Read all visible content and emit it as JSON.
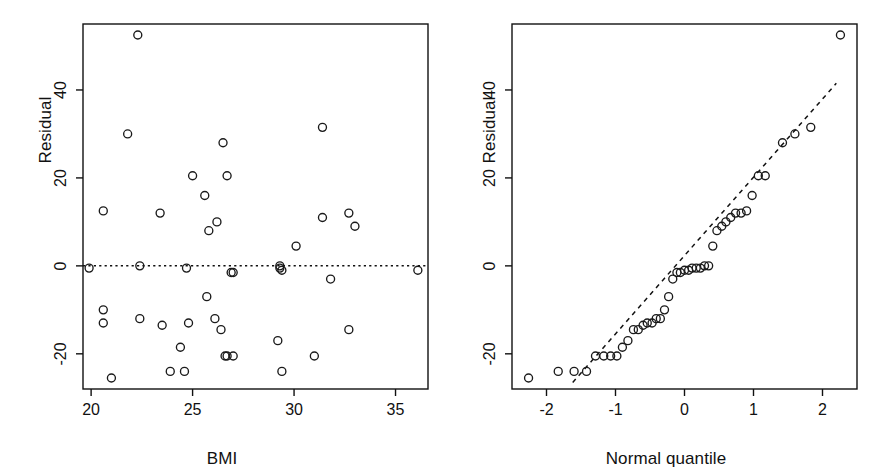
{
  "figure": {
    "background": "#ffffff",
    "ink": "#111111",
    "point_color": "#1a1a1a",
    "panels": 2
  },
  "chart_data": [
    {
      "type": "scatter",
      "panel": "left",
      "title": "",
      "xlabel": "BMI",
      "ylabel": "Residual",
      "xlim": [
        19.6,
        36.6
      ],
      "ylim": [
        -28,
        55
      ],
      "xticks": [
        20,
        25,
        30,
        35
      ],
      "xtick_labels": [
        "20",
        "25",
        "30",
        "35"
      ],
      "yticks": [
        -20,
        0,
        20,
        40
      ],
      "ytick_labels": [
        "-20",
        "0",
        "20",
        "40"
      ],
      "grid": false,
      "legend": "none",
      "reference_line": {
        "kind": "horizontal",
        "y": 0,
        "style": "dotted"
      },
      "marker": "open-circle",
      "x": [
        19.9,
        20.6,
        20.6,
        20.6,
        21.0,
        21.8,
        22.3,
        22.4,
        22.4,
        23.4,
        23.5,
        23.9,
        24.4,
        24.6,
        24.7,
        24.8,
        25.0,
        25.6,
        25.7,
        25.8,
        26.1,
        26.2,
        26.4,
        26.5,
        26.6,
        26.7,
        26.7,
        26.9,
        27.0,
        27.0,
        29.2,
        29.3,
        29.3,
        29.4,
        29.4,
        30.1,
        31.0,
        31.4,
        31.4,
        31.8,
        32.7,
        32.7,
        33.0,
        36.1
      ],
      "y": [
        -0.5,
        12.5,
        -10.0,
        -13.0,
        -25.5,
        30.0,
        52.5,
        0.0,
        -12.0,
        12.0,
        -13.5,
        -24.0,
        -18.5,
        -24.0,
        -0.5,
        -13.0,
        20.5,
        16.0,
        -7.0,
        8.0,
        -12.0,
        10.0,
        -14.5,
        28.0,
        -20.5,
        20.5,
        -20.5,
        -1.5,
        -20.5,
        -1.5,
        -17.0,
        0.0,
        -0.5,
        -1.0,
        -24.0,
        4.5,
        -20.5,
        31.5,
        11.0,
        -3.0,
        12.0,
        -14.5,
        9.0,
        -1.0
      ],
      "n_points": 44
    },
    {
      "type": "scatter",
      "panel": "right",
      "title": "",
      "xlabel": "Normal quantile",
      "ylabel": "Residual",
      "xlim": [
        -2.5,
        2.5
      ],
      "ylim": [
        -28,
        55
      ],
      "xticks": [
        -2,
        -1,
        0,
        1,
        2
      ],
      "xtick_labels": [
        "-2",
        "-1",
        "0",
        "1",
        "2"
      ],
      "yticks": [
        -20,
        0,
        20,
        40
      ],
      "ytick_labels": [
        "-20",
        "0",
        "20",
        "40"
      ],
      "grid": false,
      "legend": "none",
      "reference_line": {
        "kind": "qq-line",
        "style": "dashed",
        "x0": -1.62,
        "y0": -26.5,
        "x1": 2.2,
        "y1": 41.5
      },
      "marker": "open-circle",
      "x": [
        -2.26,
        -1.83,
        -1.6,
        -1.42,
        -1.29,
        -1.17,
        -1.07,
        -0.98,
        -0.9,
        -0.82,
        -0.74,
        -0.67,
        -0.6,
        -0.54,
        -0.47,
        -0.41,
        -0.35,
        -0.29,
        -0.23,
        -0.17,
        -0.11,
        -0.06,
        0.0,
        0.06,
        0.11,
        0.17,
        0.23,
        0.29,
        0.35,
        0.41,
        0.47,
        0.54,
        0.6,
        0.67,
        0.74,
        0.82,
        0.9,
        0.98,
        1.07,
        1.17,
        1.42,
        1.6,
        1.83,
        2.26
      ],
      "y": [
        -25.5,
        -24.0,
        -24.0,
        -24.0,
        -20.5,
        -20.5,
        -20.5,
        -20.5,
        -18.5,
        -17.0,
        -14.5,
        -14.5,
        -13.5,
        -13.0,
        -13.0,
        -12.0,
        -12.0,
        -10.0,
        -7.0,
        -3.0,
        -1.5,
        -1.5,
        -1.0,
        -1.0,
        -0.5,
        -0.5,
        -0.5,
        0.0,
        0.0,
        4.5,
        8.0,
        9.0,
        10.0,
        11.0,
        12.0,
        12.0,
        12.5,
        16.0,
        20.5,
        20.5,
        28.0,
        30.0,
        31.5,
        52.5
      ],
      "n_points": 44
    }
  ],
  "left_panel": {
    "xlabel": "BMI",
    "ylabel": "Residual",
    "xtick_labels": [
      "20",
      "25",
      "30",
      "35"
    ],
    "ytick_labels": [
      "-20",
      "0",
      "20",
      "40"
    ]
  },
  "right_panel": {
    "xlabel": "Normal quantile",
    "ylabel": "Residual",
    "xtick_labels": [
      "-2",
      "-1",
      "0",
      "1",
      "2"
    ],
    "ytick_labels": [
      "-20",
      "0",
      "20",
      "40"
    ]
  }
}
